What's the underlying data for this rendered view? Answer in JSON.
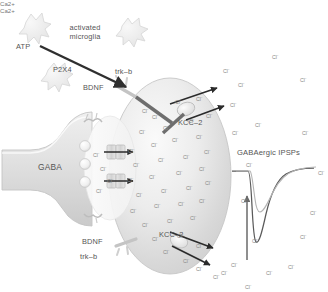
{
  "figure": {
    "width": 328,
    "height": 292,
    "background": "#ffffff"
  },
  "labels": {
    "atp": "ATP",
    "activated_microglia_line1": "activated",
    "activated_microglia_line2": "microglia",
    "p2x4": "P2X4",
    "trk_b_top": "trk–b",
    "bdnf_top": "BDNF",
    "trk_b_bottom": "trk–b",
    "bdnf_bottom": "BDNF",
    "kcc2_top": "KCC–2",
    "kcc2_bottom": "KCC–2",
    "gaba": "GABA",
    "calcium_top": "Ca2+",
    "calcium_bottom": "Ca2+",
    "ipsp_title": "GABAergic IPSPs",
    "chloride": "Cl",
    "chloride_charge": "-"
  },
  "colors": {
    "background": "#ffffff",
    "cell_fill_light": "#f3f3f3",
    "cell_fill_mid": "#dcdcdc",
    "cell_stroke": "#c9c9c9",
    "arrow_dark": "#3b3b3b",
    "arrow_mid": "#555555",
    "inhibition_bar": "#6e6e6e",
    "text": "#555555",
    "ion_text": "#8a8a8a",
    "trace_dark": "#5a5a5a",
    "trace_light": "#b0b0b0",
    "microglia_fill": "#ededed",
    "microglia_stroke": "#d4d4d4"
  },
  "chart_data": {
    "type": "line",
    "title": "GABAergic IPSPs",
    "xlabel": "",
    "ylabel": "",
    "grid": false,
    "legend": false,
    "axis_visible": false,
    "annotation_arrow": {
      "direction": "up",
      "meaning": "increase in IPSP amplitude / depolarizing shift"
    },
    "series": [
      {
        "name": "control IPSP (deep, dark trace)",
        "color": "#5a5a5a",
        "x": [
          0,
          8,
          14,
          18,
          21,
          24,
          28,
          34,
          42,
          52,
          64,
          78,
          92,
          100
        ],
        "y": [
          0,
          0,
          -2,
          -30,
          -70,
          -92,
          -100,
          -88,
          -66,
          -44,
          -26,
          -12,
          -4,
          -1
        ]
      },
      {
        "name": "shifted IPSP (shallow, light trace)",
        "color": "#b0b0b0",
        "x": [
          0,
          8,
          14,
          18,
          21,
          24,
          28,
          34,
          42,
          52,
          64,
          78,
          92,
          100
        ],
        "y": [
          0,
          0,
          -1,
          -14,
          -32,
          -44,
          -48,
          -43,
          -33,
          -22,
          -13,
          -6,
          -2,
          0
        ]
      }
    ],
    "xlim": [
      0,
      100
    ],
    "ylim": [
      -100,
      6
    ]
  },
  "intracellular_ions": [
    {
      "x": 152,
      "y": 112
    },
    {
      "x": 175,
      "y": 97
    },
    {
      "x": 196,
      "y": 94
    },
    {
      "x": 139,
      "y": 127
    },
    {
      "x": 163,
      "y": 123
    },
    {
      "x": 188,
      "y": 116
    },
    {
      "x": 206,
      "y": 111
    },
    {
      "x": 128,
      "y": 146
    },
    {
      "x": 151,
      "y": 140
    },
    {
      "x": 172,
      "y": 135
    },
    {
      "x": 196,
      "y": 132
    },
    {
      "x": 133,
      "y": 160
    },
    {
      "x": 158,
      "y": 155
    },
    {
      "x": 183,
      "y": 152
    },
    {
      "x": 204,
      "y": 147
    },
    {
      "x": 127,
      "y": 175
    },
    {
      "x": 149,
      "y": 172
    },
    {
      "x": 176,
      "y": 168
    },
    {
      "x": 199,
      "y": 164
    },
    {
      "x": 136,
      "y": 190
    },
    {
      "x": 161,
      "y": 186
    },
    {
      "x": 186,
      "y": 183
    },
    {
      "x": 205,
      "y": 178
    },
    {
      "x": 130,
      "y": 206
    },
    {
      "x": 154,
      "y": 201
    },
    {
      "x": 178,
      "y": 199
    },
    {
      "x": 199,
      "y": 196
    },
    {
      "x": 142,
      "y": 220
    },
    {
      "x": 167,
      "y": 216
    },
    {
      "x": 190,
      "y": 213
    },
    {
      "x": 152,
      "y": 234
    },
    {
      "x": 177,
      "y": 231
    },
    {
      "x": 196,
      "y": 241
    },
    {
      "x": 163,
      "y": 247
    },
    {
      "x": 142,
      "y": 106
    },
    {
      "x": 183,
      "y": 256
    }
  ],
  "extracellular_ions": [
    {
      "x": 272,
      "y": 52
    },
    {
      "x": 300,
      "y": 75
    },
    {
      "x": 255,
      "y": 120
    },
    {
      "x": 230,
      "y": 100
    },
    {
      "x": 232,
      "y": 128
    },
    {
      "x": 302,
      "y": 128
    },
    {
      "x": 246,
      "y": 160
    },
    {
      "x": 318,
      "y": 168
    },
    {
      "x": 241,
      "y": 196
    },
    {
      "x": 310,
      "y": 208
    },
    {
      "x": 252,
      "y": 236
    },
    {
      "x": 300,
      "y": 232
    },
    {
      "x": 231,
      "y": 260
    },
    {
      "x": 213,
      "y": 272
    },
    {
      "x": 245,
      "y": 282
    },
    {
      "x": 196,
      "y": 264
    },
    {
      "x": 288,
      "y": 262
    },
    {
      "x": 93,
      "y": 150
    },
    {
      "x": 100,
      "y": 164
    },
    {
      "x": 107,
      "y": 176
    },
    {
      "x": 96,
      "y": 186
    },
    {
      "x": 223,
      "y": 66
    },
    {
      "x": 238,
      "y": 80
    },
    {
      "x": 221,
      "y": 268
    },
    {
      "x": 266,
      "y": 268
    }
  ],
  "cleft_arrows": [
    {
      "label": "chloride influx upper",
      "x1": 104,
      "y1": 152,
      "x2": 131,
      "y2": 152
    },
    {
      "label": "chloride influx lower",
      "x1": 104,
      "y1": 181,
      "x2": 131,
      "y2": 181
    }
  ],
  "kcc2_arrows": [
    {
      "label": "chloride efflux upper-1",
      "x1": 185,
      "y1": 103,
      "x2": 219,
      "y2": 90
    },
    {
      "label": "chloride efflux upper-2",
      "x1": 190,
      "y1": 117,
      "x2": 224,
      "y2": 108
    },
    {
      "label": "chloride flux lower-1",
      "x1": 178,
      "y1": 233,
      "x2": 213,
      "y2": 247
    },
    {
      "label": "chloride flux lower-2",
      "x1": 175,
      "y1": 247,
      "x2": 211,
      "y2": 263
    }
  ]
}
